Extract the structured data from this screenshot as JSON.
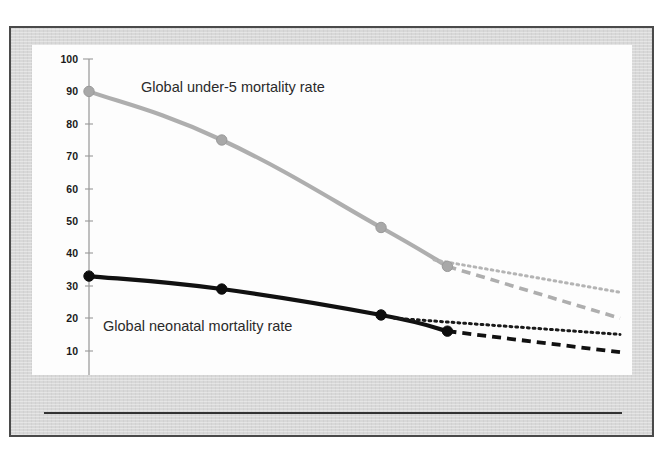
{
  "figure": {
    "background_color": "#d8d8d8",
    "frame_color": "#4a4a4a",
    "plot_background": "#fdfdfd"
  },
  "chart_data": {
    "type": "line",
    "title": "",
    "subtitle": "",
    "xlabel": "",
    "ylabel": "",
    "xlim": [
      1990,
      2030
    ],
    "ylim": [
      0,
      100
    ],
    "grid": false,
    "legend_position": "inline-annotation",
    "x_ticks": [
      1990,
      1995,
      2000,
      2005,
      2010,
      2015,
      2020,
      2025,
      2030
    ],
    "y_ticks": [
      0,
      10,
      20,
      30,
      40,
      50,
      60,
      70,
      80,
      90,
      100
    ],
    "annotations": [
      {
        "text": "Global under-5 mortality rate",
        "x": 1998,
        "y": 91
      },
      {
        "text": "Global neonatal mortality rate",
        "x": 1993,
        "y": 19
      }
    ],
    "series": [
      {
        "name": "Global under-5 mortality rate",
        "style": "solid",
        "color": "#aeaeae",
        "markers": true,
        "x": [
          1990,
          2000,
          2012,
          2017
        ],
        "values": [
          90,
          75,
          48,
          36
        ]
      },
      {
        "name": "Global under-5 mortality rate (projection, current trend)",
        "style": "dashed",
        "color": "#aeaeae",
        "markers": false,
        "x": [
          2017,
          2030
        ],
        "values": [
          36,
          20
        ]
      },
      {
        "name": "Global under-5 mortality rate (projection, slower decline)",
        "style": "dotted",
        "color": "#b4b4b4",
        "markers": false,
        "x": [
          2016,
          2030
        ],
        "values": [
          38,
          28
        ]
      },
      {
        "name": "Global neonatal mortality rate",
        "style": "solid",
        "color": "#111111",
        "markers": true,
        "x": [
          1990,
          2000,
          2012,
          2017
        ],
        "values": [
          33,
          29,
          21,
          16
        ]
      },
      {
        "name": "Global neonatal mortality rate (projection, current trend)",
        "style": "dashed",
        "color": "#111111",
        "markers": false,
        "x": [
          2017,
          2030
        ],
        "values": [
          16,
          9.5
        ]
      },
      {
        "name": "Global neonatal mortality rate (projection, slower decline)",
        "style": "dotted",
        "color": "#1a1a1a",
        "markers": false,
        "x": [
          2013,
          2030
        ],
        "values": [
          20,
          15
        ]
      }
    ]
  },
  "axis": {
    "y_labels": [
      "100",
      "90",
      "80",
      "70",
      "60",
      "50",
      "40",
      "30",
      "20",
      "10",
      "0"
    ],
    "x_labels": [
      "1990",
      "1995",
      "2000",
      "2005",
      "2010",
      "2015",
      "2020",
      "2025",
      "2030"
    ]
  },
  "labels": {
    "under5": "Global under-5 mortality rate",
    "neonatal": "Global neonatal mortality rate"
  }
}
